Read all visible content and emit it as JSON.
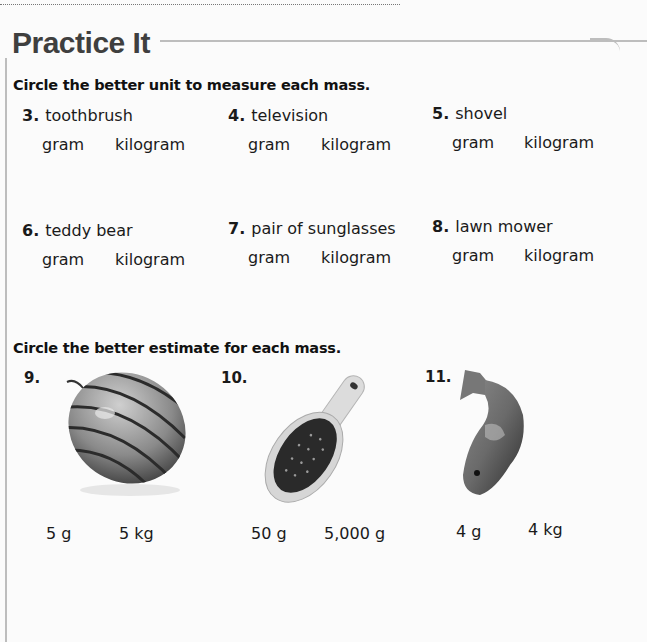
{
  "section_title": "Practice It",
  "part1": {
    "instruction": "Circle the better unit to measure each mass.",
    "items": [
      {
        "number": "3.",
        "object": "toothbrush",
        "choices": [
          "gram",
          "kilogram"
        ]
      },
      {
        "number": "4.",
        "object": "television",
        "choices": [
          "gram",
          "kilogram"
        ]
      },
      {
        "number": "5.",
        "object": "shovel",
        "choices": [
          "gram",
          "kilogram"
        ]
      },
      {
        "number": "6.",
        "object": "teddy bear",
        "choices": [
          "gram",
          "kilogram"
        ]
      },
      {
        "number": "7.",
        "object": "pair of sunglasses",
        "choices": [
          "gram",
          "kilogram"
        ]
      },
      {
        "number": "8.",
        "object": "lawn mower",
        "choices": [
          "gram",
          "kilogram"
        ]
      }
    ]
  },
  "part2": {
    "instruction": "Circle the better estimate for each mass.",
    "items": [
      {
        "number": "9.",
        "picture": "watermelon",
        "choices": [
          "5 g",
          "5 kg"
        ]
      },
      {
        "number": "10.",
        "picture": "hairbrush",
        "choices": [
          "50 g",
          "5,000 g"
        ]
      },
      {
        "number": "11.",
        "picture": "fish",
        "choices": [
          "4 g",
          "4 kg"
        ]
      }
    ]
  }
}
